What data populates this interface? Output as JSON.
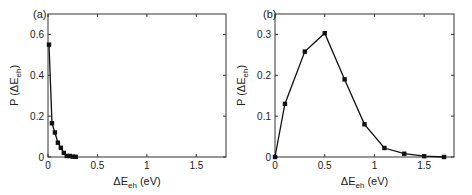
{
  "chart_data": [
    {
      "type": "line",
      "panel_label": "(a)",
      "title": "",
      "xlabel": "ΔE_eh (eV)",
      "ylabel": "P (ΔE_eh)",
      "xlim": [
        0,
        1.8
      ],
      "ylim": [
        0,
        0.7
      ],
      "xticks": [
        "0",
        "0.5",
        "1",
        "1.5"
      ],
      "yticks": [
        "0",
        "0.2",
        "0.4",
        "0.6"
      ],
      "grid": false,
      "series": [
        {
          "name": "P(ΔE_eh)",
          "x": [
            0.01,
            0.04,
            0.07,
            0.1,
            0.13,
            0.16,
            0.19,
            0.22,
            0.25,
            0.28
          ],
          "y": [
            0.55,
            0.165,
            0.12,
            0.07,
            0.045,
            0.02,
            0.005,
            0.005,
            0.002,
            0.001
          ]
        }
      ]
    },
    {
      "type": "line",
      "panel_label": "(b)",
      "title": "",
      "xlabel": "ΔE_eh (eV)",
      "ylabel": "P (ΔE_eh)",
      "xlim": [
        0,
        1.8
      ],
      "ylim": [
        0,
        0.35
      ],
      "xticks": [
        "0",
        "0.5",
        "1",
        "1.5"
      ],
      "yticks": [
        "0",
        "0.1",
        "0.2",
        "0.3"
      ],
      "grid": false,
      "series": [
        {
          "name": "P(ΔE_eh)",
          "x": [
            0,
            0.1,
            0.3,
            0.5,
            0.7,
            0.9,
            1.1,
            1.3,
            1.5,
            1.7
          ],
          "y": [
            0,
            0.13,
            0.258,
            0.303,
            0.19,
            0.08,
            0.022,
            0.008,
            0.002,
            0.0
          ]
        }
      ]
    }
  ]
}
